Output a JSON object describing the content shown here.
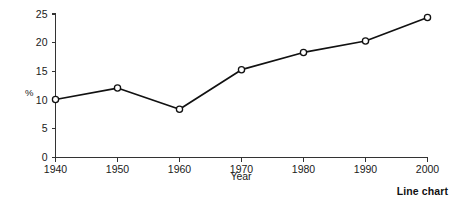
{
  "caption": "Line chart",
  "chart_data": {
    "type": "line",
    "title": "",
    "subtitle": "",
    "xlabel": "Year",
    "ylabel": "%",
    "categories": [
      "1940",
      "1950",
      "1960",
      "1970",
      "1980",
      "1990",
      "2000"
    ],
    "x": [
      1940,
      1950,
      1960,
      1970,
      1980,
      1990,
      2000
    ],
    "values": [
      10.1,
      12.1,
      8.4,
      15.3,
      18.3,
      20.3,
      24.4
    ],
    "xlim": [
      1940,
      2000
    ],
    "ylim": [
      0,
      25
    ],
    "xticks": [
      1940,
      1950,
      1960,
      1970,
      1980,
      1990,
      2000
    ],
    "xtick_labels": [
      "1940",
      "1950",
      "1960",
      "1970",
      "1980",
      "1990",
      "2000"
    ],
    "yticks": [
      0,
      5,
      10,
      15,
      20,
      25
    ],
    "ytick_labels": [
      "0",
      "5",
      "10",
      "15",
      "20",
      "25"
    ],
    "grid": false,
    "legend": "none",
    "marker": "open-circle",
    "line_color": "#111111",
    "marker_fill": "#ffffff",
    "marker_edge": "#111111",
    "axis_color": "#333333",
    "background": "#ffffff"
  }
}
